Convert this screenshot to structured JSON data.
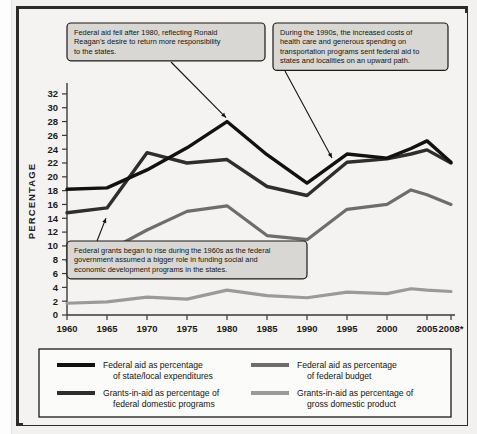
{
  "chart_data": {
    "type": "line",
    "title": "",
    "xlabel": "",
    "ylabel": "PERCENTAGE",
    "x": [
      1960,
      1965,
      1970,
      1975,
      1980,
      1985,
      1990,
      1995,
      2000,
      2003,
      2005,
      2008
    ],
    "xtick_labels": [
      "1960",
      "1965",
      "1970",
      "1975",
      "1980",
      "1985",
      "1990",
      "1995",
      "2000",
      "2005",
      "2008*"
    ],
    "xtick_values": [
      1960,
      1965,
      1970,
      1975,
      1980,
      1985,
      1990,
      1995,
      2000,
      2005,
      2008
    ],
    "ytick_labels": [
      "0",
      "2",
      "4",
      "6",
      "8",
      "10",
      "12",
      "14",
      "16",
      "18",
      "20",
      "22",
      "24",
      "26",
      "28",
      "30",
      "32"
    ],
    "ytick_values": [
      0,
      2,
      4,
      6,
      8,
      10,
      12,
      14,
      16,
      18,
      20,
      22,
      24,
      26,
      28,
      30,
      32
    ],
    "ylim": [
      0,
      33
    ],
    "xlim": [
      1960,
      2008
    ],
    "grid": false,
    "legend_position": "bottom",
    "series": [
      {
        "name": "Federal aid as percentage of state/local expenditures",
        "color": "#111111",
        "width": 3.4,
        "values": [
          18.2,
          18.4,
          21.0,
          24.2,
          28.0,
          23.2,
          19.1,
          23.3,
          22.7,
          24.1,
          25.2,
          22.1
        ]
      },
      {
        "name": "Grants-in-aid as percentage of federal domestic programs",
        "color": "#2f2e2c",
        "width": 3.4,
        "values": [
          14.8,
          15.5,
          23.5,
          22.0,
          22.5,
          18.6,
          17.3,
          22.1,
          22.6,
          23.3,
          23.9,
          22.0
        ]
      },
      {
        "name": "Federal aid as percentage of federal budget",
        "color": "#6e6d6b",
        "width": 3.2,
        "values": [
          7.8,
          9.2,
          12.3,
          15.0,
          15.8,
          11.5,
          10.9,
          15.3,
          16.0,
          18.1,
          17.4,
          16.0
        ]
      },
      {
        "name": "Grants-in-aid as percentage of gross domestic product",
        "color": "#9b9a98",
        "width": 3.2,
        "values": [
          1.7,
          1.9,
          2.6,
          2.3,
          3.6,
          2.8,
          2.5,
          3.3,
          3.1,
          3.8,
          3.6,
          3.4
        ]
      }
    ],
    "annotations": [
      {
        "id": "reagan-note",
        "lines": [
          "Federal aid fell after 1980, reflecting Ronald",
          "Reagan's desire to return more responsibility",
          "to the states."
        ],
        "points_to": {
          "year": 1980,
          "value": 28.0
        }
      },
      {
        "id": "nineties-note",
        "lines": [
          "During the 1990s, the increased costs of",
          "health care and generous spending on",
          "transportation programs sent federal aid to",
          "states and localities on an upward path."
        ],
        "points_to": {
          "year": 1993,
          "value": 22.3
        }
      },
      {
        "id": "sixties-note",
        "lines": [
          "Federal grants began to rise during the 1960s as the federal",
          "government assumed a bigger role in funding social and",
          "economic development programs in the states."
        ],
        "points_to": {
          "year": 1965,
          "value": 14.6
        }
      }
    ]
  },
  "legend": {
    "entries": [
      {
        "swatch_color": "#111111",
        "line1": "Federal aid as percentage",
        "line2": "of state/local expenditures"
      },
      {
        "swatch_color": "#6e6d6b",
        "line1": "Federal aid as percentage",
        "line2": "of federal budget"
      },
      {
        "swatch_color": "#2f2e2c",
        "line1": "Grants-in-aid as percentage of",
        "line2": "federal domestic programs"
      },
      {
        "swatch_color": "#9b9a98",
        "line1": "Grants-in-aid as percentage of",
        "line2": "gross domestic product"
      }
    ]
  }
}
